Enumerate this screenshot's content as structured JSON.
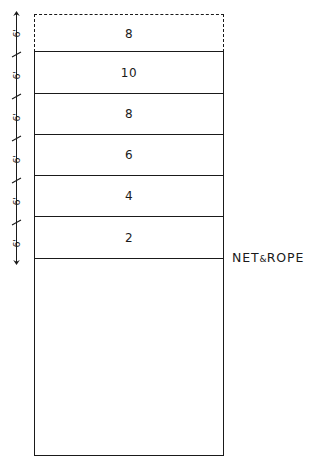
{
  "diagram": {
    "ink_color": "#1a1a1a",
    "background_color": "#ffffff",
    "dimension_chain": {
      "orientation": "vertical",
      "position": "left",
      "terminator": "arrow",
      "tick_style": "slash",
      "segments": [
        {
          "label": "6'"
        },
        {
          "label": "6'"
        },
        {
          "label": "6'"
        },
        {
          "label": "6'"
        },
        {
          "label": "6'"
        },
        {
          "label": "6'"
        }
      ]
    },
    "dashed_band": {
      "label": "8",
      "border_style": "dashed"
    },
    "bands": [
      {
        "label": "10"
      },
      {
        "label": "8"
      },
      {
        "label": "6"
      },
      {
        "label": "4"
      },
      {
        "label": "2"
      }
    ],
    "annotations": [
      {
        "text": "NET",
        "amp": "&",
        "text2": "ROPE"
      }
    ]
  }
}
